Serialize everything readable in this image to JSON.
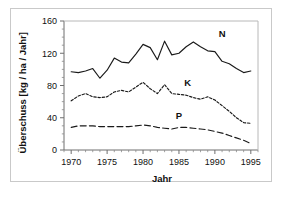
{
  "chart_data": {
    "type": "line",
    "title": "",
    "xlabel": "Jahr",
    "ylabel": "Überschuss [kg / ha / Jahr]",
    "xlim": [
      1969,
      1996
    ],
    "ylim": [
      0,
      160
    ],
    "xticks": [
      1970,
      1975,
      1980,
      1985,
      1990,
      1995
    ],
    "xticklabels": [
      "1970",
      "1975",
      "1980",
      "1985",
      "1990",
      "1995"
    ],
    "yticks": [
      0,
      40,
      80,
      120,
      160
    ],
    "yticklabels": [
      "0",
      "40",
      "80",
      "120",
      "160"
    ],
    "grid": false,
    "legend_position": "inline-annotations",
    "x": [
      1970,
      1971,
      1972,
      1973,
      1974,
      1975,
      1976,
      1977,
      1978,
      1979,
      1980,
      1981,
      1982,
      1983,
      1984,
      1985,
      1986,
      1987,
      1988,
      1989,
      1990,
      1991,
      1992,
      1993,
      1994,
      1995
    ],
    "series": [
      {
        "name": "N",
        "label": "N",
        "linestyle": "solid",
        "color": "#1a1a1a",
        "values": [
          97,
          96,
          98,
          101,
          89,
          99,
          114,
          109,
          108,
          119,
          131,
          127,
          112,
          135,
          118,
          120,
          128,
          134,
          128,
          123,
          122,
          110,
          107,
          101,
          96,
          98
        ]
      },
      {
        "name": "K",
        "label": "K",
        "linestyle": "dotted",
        "color": "#1a1a1a",
        "values": [
          61,
          67,
          70,
          66,
          65,
          66,
          72,
          74,
          72,
          78,
          84,
          76,
          70,
          81,
          70,
          69,
          68,
          65,
          63,
          66,
          62,
          55,
          48,
          40,
          34,
          33
        ]
      },
      {
        "name": "P",
        "label": "P",
        "linestyle": "dashed",
        "color": "#1a1a1a",
        "values": [
          28,
          30,
          30,
          30,
          29,
          29,
          29,
          29,
          29,
          30,
          31,
          30,
          28,
          27,
          26,
          28,
          28,
          27,
          26,
          25,
          23,
          21,
          18,
          15,
          12,
          8
        ]
      }
    ],
    "annotations": [
      {
        "text": "N",
        "x": 1991.0,
        "y": 140
      },
      {
        "text": "K",
        "x": 1986.2,
        "y": 80
      },
      {
        "text": "P",
        "x": 1985.0,
        "y": 38
      }
    ]
  }
}
